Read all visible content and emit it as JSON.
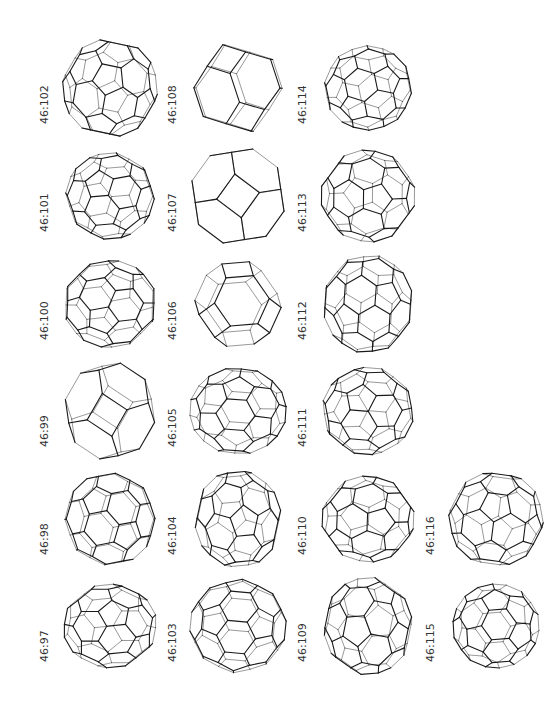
{
  "figure": {
    "title": "",
    "grid": {
      "columns": [
        [
          "46:102",
          "46:101",
          "46:100",
          "46:99",
          "46:98",
          "46:97"
        ],
        [
          "46:108",
          "46:107",
          "46:106",
          "46:105",
          "46:104",
          "46:103"
        ],
        [
          "46:114",
          "46:113",
          "46:112",
          "46:111",
          "46:110",
          "46:109"
        ],
        [
          "",
          "",
          "",
          "",
          "46:116",
          "46:115"
        ]
      ]
    },
    "items": [
      {
        "label": "46:102",
        "style": "dense"
      },
      {
        "label": "46:101",
        "style": "dense"
      },
      {
        "label": "46:100",
        "style": "dense"
      },
      {
        "label": "46:99",
        "style": "simple"
      },
      {
        "label": "46:98",
        "style": "dense"
      },
      {
        "label": "46:97",
        "style": "dense"
      },
      {
        "label": "46:108",
        "style": "simple"
      },
      {
        "label": "46:107",
        "style": "simple"
      },
      {
        "label": "46:106",
        "style": "simple"
      },
      {
        "label": "46:105",
        "style": "dense"
      },
      {
        "label": "46:104",
        "style": "dense"
      },
      {
        "label": "46:103",
        "style": "dense"
      },
      {
        "label": "46:114",
        "style": "dense"
      },
      {
        "label": "46:113",
        "style": "dense"
      },
      {
        "label": "46:112",
        "style": "dense"
      },
      {
        "label": "46:111",
        "style": "dense"
      },
      {
        "label": "46:110",
        "style": "dense"
      },
      {
        "label": "46:109",
        "style": "dense"
      },
      {
        "label": "46:116",
        "style": "dense"
      },
      {
        "label": "46:115",
        "style": "dense"
      }
    ],
    "colors": {
      "line": "#1a1a1a",
      "label": "#333333",
      "background": "#ffffff"
    }
  }
}
